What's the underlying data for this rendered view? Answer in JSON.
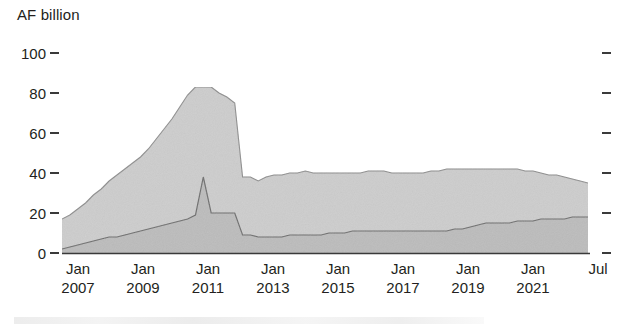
{
  "chart_data": {
    "type": "area",
    "title": "",
    "subtitle": "",
    "ylabel": "AF billion",
    "xlabel": "",
    "ylim": [
      0,
      100
    ],
    "yticks": [
      0,
      20,
      40,
      60,
      80,
      100
    ],
    "ytick_labels": [
      "0",
      "20",
      "40",
      "60",
      "80",
      "100"
    ],
    "grid": false,
    "legend_position": "none",
    "stacked": true,
    "axis_color": "#3a3a3a",
    "series_colors": [
      "#bfbfbf",
      "#cfcfcf"
    ],
    "xtick_labels": [
      {
        "month": "Jan",
        "year": "2007"
      },
      {
        "month": "Jan",
        "year": "2009"
      },
      {
        "month": "Jan",
        "year": "2011"
      },
      {
        "month": "Jan",
        "year": "2013"
      },
      {
        "month": "Jan",
        "year": "2015"
      },
      {
        "month": "Jan",
        "year": "2017"
      },
      {
        "month": "Jan",
        "year": "2019"
      },
      {
        "month": "Jan",
        "year": "2021"
      },
      {
        "month": "Jul",
        "year": ""
      }
    ],
    "x": [
      "2006-10",
      "2007-01",
      "2007-04",
      "2007-07",
      "2007-10",
      "2008-01",
      "2008-04",
      "2008-07",
      "2008-10",
      "2009-01",
      "2009-04",
      "2009-07",
      "2009-10",
      "2010-01",
      "2010-04",
      "2010-07",
      "2010-10",
      "2011-01",
      "2011-02",
      "2011-03",
      "2011-04",
      "2011-05",
      "2011-06",
      "2011-07",
      "2011-10",
      "2012-01",
      "2012-04",
      "2012-07",
      "2012-10",
      "2013-01",
      "2013-04",
      "2013-07",
      "2013-10",
      "2014-01",
      "2014-04",
      "2014-07",
      "2014-10",
      "2015-01",
      "2015-04",
      "2015-07",
      "2015-10",
      "2016-01",
      "2016-04",
      "2016-07",
      "2016-10",
      "2017-01",
      "2017-04",
      "2017-07",
      "2017-10",
      "2018-01",
      "2018-04",
      "2018-07",
      "2018-10",
      "2019-01",
      "2019-04",
      "2019-07",
      "2019-10",
      "2020-01",
      "2020-04",
      "2020-07",
      "2020-10",
      "2021-01",
      "2021-04",
      "2021-07",
      "2021-10",
      "2022-01",
      "2022-04",
      "2022-07"
    ],
    "series": [
      {
        "name": "lower-band",
        "values": [
          2,
          3,
          4,
          5,
          6,
          7,
          8,
          8,
          9,
          10,
          11,
          12,
          13,
          14,
          15,
          16,
          17,
          19,
          38,
          20,
          20,
          20,
          20,
          9,
          9,
          8,
          8,
          8,
          8,
          9,
          9,
          9,
          9,
          9,
          10,
          10,
          10,
          11,
          11,
          11,
          11,
          11,
          11,
          11,
          11,
          11,
          11,
          11,
          11,
          11,
          12,
          12,
          13,
          14,
          15,
          15,
          15,
          15,
          16,
          16,
          16,
          17,
          17,
          17,
          17,
          18,
          18,
          18
        ]
      },
      {
        "name": "upper-band",
        "values": [
          15,
          16,
          18,
          20,
          23,
          25,
          28,
          31,
          33,
          35,
          37,
          40,
          44,
          48,
          52,
          57,
          62,
          64,
          45,
          63,
          60,
          58,
          55,
          29,
          29,
          28,
          30,
          31,
          31,
          31,
          31,
          32,
          31,
          31,
          30,
          30,
          30,
          29,
          29,
          30,
          30,
          30,
          29,
          29,
          29,
          29,
          29,
          30,
          30,
          31,
          30,
          30,
          29,
          28,
          27,
          27,
          27,
          27,
          26,
          25,
          25,
          23,
          22,
          22,
          21,
          19,
          18,
          17
        ]
      }
    ],
    "totals_note": "stacked total peaks near 83 in early 2011 then falls sharply to about 38"
  }
}
